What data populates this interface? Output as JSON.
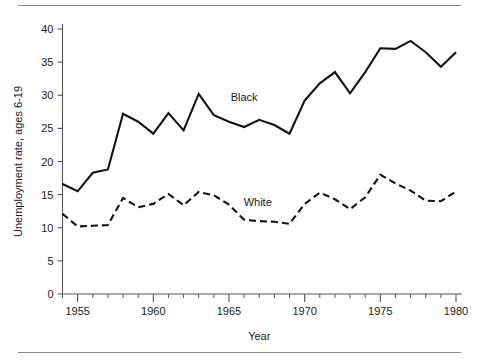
{
  "figure": {
    "name": "unemployment-rate-line-chart",
    "background": "#ffffff",
    "line_color": "#121212",
    "axis_color": "#555555",
    "rule_color": "#8a8a8a"
  },
  "chart_data": {
    "type": "line",
    "title": "",
    "xlabel": "Year",
    "ylabel": "Unemployment rate, ages 6-19",
    "xlim": [
      1954,
      1980
    ],
    "ylim": [
      0,
      40
    ],
    "grid": false,
    "legend_position": "inline-annotation",
    "y_ticks": [
      0,
      5,
      10,
      15,
      20,
      25,
      30,
      35,
      40
    ],
    "y_tick_labels": [
      "0",
      "5",
      "10",
      "15",
      "20",
      "25",
      "30",
      "35",
      "40"
    ],
    "x_ticks_major": [
      1955,
      1960,
      1965,
      1970,
      1975,
      1980
    ],
    "x_tick_labels": [
      "1955",
      "1960",
      "1965",
      "1970",
      "1975",
      "1980"
    ],
    "x_ticks_minor": [
      1954,
      1956,
      1957,
      1958,
      1959,
      1961,
      1962,
      1963,
      1964,
      1966,
      1967,
      1968,
      1969,
      1971,
      1972,
      1973,
      1974,
      1976,
      1977,
      1978,
      1979
    ],
    "x": [
      1954,
      1955,
      1956,
      1957,
      1958,
      1959,
      1960,
      1961,
      1962,
      1963,
      1964,
      1965,
      1966,
      1967,
      1968,
      1969,
      1970,
      1971,
      1972,
      1973,
      1974,
      1975,
      1976,
      1977,
      1978,
      1979,
      1980
    ],
    "series": [
      {
        "name": "Black",
        "style": "solid",
        "label": "Black",
        "label_x": 1966,
        "label_y": 29.2,
        "values": [
          16.6,
          15.5,
          18.3,
          18.8,
          27.2,
          26.0,
          24.2,
          27.3,
          24.7,
          30.2,
          27.0,
          26.0,
          25.2,
          26.3,
          25.5,
          24.2,
          29.2,
          31.8,
          33.5,
          30.3,
          33.5,
          37.1,
          37.0,
          38.2,
          36.5,
          34.3,
          36.5
        ]
      },
      {
        "name": "White",
        "style": "dashed",
        "label": "White",
        "label_x": 1966.9,
        "label_y": 13.3,
        "values": [
          12.1,
          10.2,
          10.3,
          10.4,
          14.5,
          13.1,
          13.6,
          15.1,
          13.4,
          15.4,
          14.9,
          13.5,
          11.2,
          11.0,
          10.9,
          10.6,
          13.6,
          15.3,
          14.3,
          12.8,
          14.6,
          18.0,
          16.7,
          15.6,
          14.1,
          14.0,
          15.5
        ]
      }
    ]
  }
}
